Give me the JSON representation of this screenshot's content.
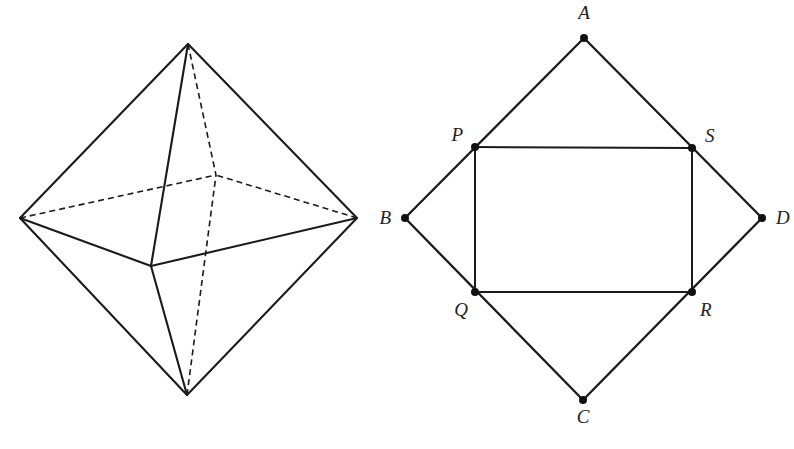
{
  "figure": {
    "background_color": "#ffffff",
    "line_color": "#1a1a1a",
    "label_color": "#222222",
    "canvas": {
      "width": 794,
      "height": 449
    }
  },
  "left_figure": {
    "name": "octahedron",
    "caption": "",
    "vertices": {
      "top": {
        "label": "",
        "x": 188,
        "y": 44
      },
      "bottom": {
        "label": "",
        "x": 187,
        "y": 395
      },
      "left": {
        "label": "",
        "x": 20,
        "y": 218
      },
      "right": {
        "label": "",
        "x": 357,
        "y": 218
      },
      "front": {
        "label": "",
        "x": 151,
        "y": 266
      },
      "back": {
        "label": "",
        "x": 216,
        "y": 175
      }
    },
    "solid_edges": [
      [
        "top",
        "left"
      ],
      [
        "top",
        "right"
      ],
      [
        "bottom",
        "left"
      ],
      [
        "bottom",
        "right"
      ],
      [
        "top",
        "front"
      ],
      [
        "bottom",
        "front"
      ],
      [
        "left",
        "front"
      ],
      [
        "right",
        "front"
      ]
    ],
    "dashed_edges": [
      [
        "top",
        "back"
      ],
      [
        "bottom",
        "back"
      ],
      [
        "left",
        "back"
      ],
      [
        "right",
        "back"
      ]
    ]
  },
  "right_figure": {
    "name": "rhombus-with-rectangle",
    "caption": "",
    "vertices": [
      {
        "label": "A",
        "x": 584,
        "y": 38,
        "label_x": 584,
        "label_y": 19,
        "label_anchor": "middle"
      },
      {
        "label": "B",
        "x": 405,
        "y": 218,
        "label_x": 391,
        "label_y": 224,
        "label_anchor": "end"
      },
      {
        "label": "C",
        "x": 583,
        "y": 400,
        "label_x": 583,
        "label_y": 423,
        "label_anchor": "middle"
      },
      {
        "label": "D",
        "x": 762,
        "y": 218,
        "label_x": 776,
        "label_y": 224,
        "label_anchor": "start"
      },
      {
        "label": "P",
        "x": 475,
        "y": 147,
        "label_x": 463,
        "label_y": 141,
        "label_anchor": "end"
      },
      {
        "label": "S",
        "x": 692,
        "y": 148,
        "label_x": 705,
        "label_y": 142,
        "label_anchor": "start"
      },
      {
        "label": "Q",
        "x": 475,
        "y": 292,
        "label_x": 468,
        "label_y": 316,
        "label_anchor": "end"
      },
      {
        "label": "R",
        "x": 692,
        "y": 292,
        "label_x": 700,
        "label_y": 316,
        "label_anchor": "start"
      }
    ],
    "rhombus_edges": [
      [
        "A",
        "B"
      ],
      [
        "B",
        "C"
      ],
      [
        "C",
        "D"
      ],
      [
        "D",
        "A"
      ]
    ],
    "rectangle_edges": [
      [
        "P",
        "S"
      ],
      [
        "S",
        "R"
      ],
      [
        "R",
        "Q"
      ],
      [
        "Q",
        "P"
      ]
    ],
    "rectangle_name": "PQRS",
    "dot_radius": 4
  }
}
